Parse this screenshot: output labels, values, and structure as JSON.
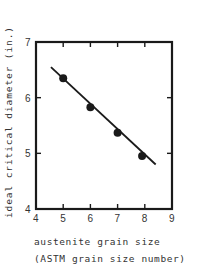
{
  "chart_data": {
    "type": "line",
    "title": "",
    "xlabel": "austenite grain size",
    "xlabel_sub": "(ASTM grain size number)",
    "ylabel": "ideal critical diameter (in.)",
    "xlim": [
      4,
      9
    ],
    "ylim": [
      4,
      7
    ],
    "xticks": [
      "4",
      "5",
      "6",
      "7",
      "8",
      "9"
    ],
    "yticks": [
      "4",
      "5",
      "6",
      "7"
    ],
    "grid": false,
    "legend": null,
    "series": [
      {
        "name": "measured",
        "marker": "filled-circle",
        "x": [
          5.0,
          6.0,
          7.0,
          7.9
        ],
        "y": [
          6.35,
          5.83,
          5.37,
          4.95
        ]
      },
      {
        "name": "fit-line",
        "marker": "none",
        "x": [
          4.55,
          8.4
        ],
        "y": [
          6.55,
          4.8
        ]
      }
    ],
    "colors": {
      "line": "#1a1a1a",
      "frame": "#1a1a1a",
      "text": "#333333",
      "background": "#ffffff"
    }
  }
}
